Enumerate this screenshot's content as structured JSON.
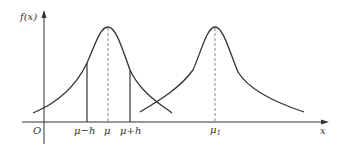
{
  "diagram": {
    "y_axis_label": "f(x)",
    "x_axis_label": "x",
    "origin_label": "O",
    "tick_labels": {
      "mu_minus_h": "μ−h",
      "mu": "μ",
      "mu_plus_h": "μ+h",
      "mu1_base": "μ",
      "mu1_sub": "1"
    },
    "colors": {
      "line": "#333333",
      "dashed": "#888888",
      "background": "#ffffff"
    }
  }
}
